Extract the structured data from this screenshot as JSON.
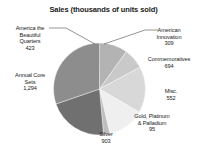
{
  "chart_data": {
    "type": "pie",
    "title": "Sales (thousands of units sold)",
    "xlabel": "",
    "ylabel": "",
    "legend": "none",
    "grid": false,
    "total": 4270,
    "categories": [
      "America the Beautiful Quarters",
      "American Innovation",
      "Commemoratives",
      "Misc.",
      "Gold, Platinum & Palladium",
      "Silver",
      "Annual Core Sets"
    ],
    "values": [
      423,
      309,
      694,
      552,
      95,
      903,
      1294
    ],
    "slices": [
      {
        "label_line1": "America the",
        "label_line2": "Beautiful",
        "label_line3": "Quarters",
        "value": "423",
        "color": "#b3b3b3",
        "start": 0,
        "sweep": 35.7
      },
      {
        "label_line1": "American",
        "label_line2": "Innovation",
        "label_line3": "",
        "value": "309",
        "color": "#c9c9c9",
        "start": 35.7,
        "sweep": 26.1
      },
      {
        "label_line1": "Commemoratives",
        "label_line2": "",
        "label_line3": "",
        "value": "694",
        "color": "#d8d8d8",
        "start": 61.8,
        "sweep": 58.5
      },
      {
        "label_line1": "Misc.",
        "label_line2": "",
        "label_line3": "",
        "value": "552",
        "color": "#efefef",
        "start": 120.3,
        "sweep": 46.6
      },
      {
        "label_line1": "Gold, Platinum",
        "label_line2": "& Palladium",
        "label_line3": "",
        "value": "95",
        "color": "#bdbdbd",
        "start": 166.9,
        "sweep": 8.0
      },
      {
        "label_line1": "Silver",
        "label_line2": "",
        "label_line3": "",
        "value": "903",
        "color": "#707070",
        "start": 174.9,
        "sweep": 76.1
      },
      {
        "label_line1": "Annual Core",
        "label_line2": "Sets",
        "label_line3": "",
        "value": "1,294",
        "color": "#8d8d8d",
        "start": 251.0,
        "sweep": 109.1
      }
    ]
  }
}
